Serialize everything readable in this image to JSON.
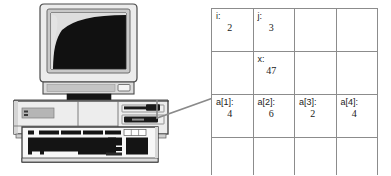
{
  "figure": {
    "caption": "",
    "connector": {
      "name": "leader-line",
      "color": "#8a8a8a"
    }
  },
  "computer": {
    "name": "desktop-computer-illustration",
    "parts": {
      "monitor": "crt-monitor",
      "screen": "monitor-screen",
      "screen_color": "#121212",
      "bezel_color": "#d9d9d9",
      "case": "desktop-case",
      "case_color": "#e6e6e6",
      "keyboard": "keyboard",
      "keyboard_color": "#f2f2f2",
      "drive_bay": "floppy-drive-bay",
      "power_button": "power-button"
    }
  },
  "memory_table": {
    "name": "memory-variables-table",
    "rows": [
      [
        {
          "label": "i:",
          "value": "2",
          "empty": false
        },
        {
          "label": "j:",
          "value": "3",
          "empty": false
        },
        {
          "label": "",
          "value": "",
          "empty": true
        },
        {
          "label": "",
          "value": "",
          "empty": true
        }
      ],
      [
        {
          "label": "",
          "value": "",
          "empty": true
        },
        {
          "label": "x:",
          "value": "47",
          "empty": false
        },
        {
          "label": "",
          "value": "",
          "empty": true
        },
        {
          "label": "",
          "value": "",
          "empty": true
        }
      ],
      [
        {
          "label": "a[1]:",
          "value": "4",
          "empty": false
        },
        {
          "label": "a[2]:",
          "value": "6",
          "empty": false
        },
        {
          "label": "a[3]:",
          "value": "2",
          "empty": false
        },
        {
          "label": "a[4]:",
          "value": "4",
          "empty": false
        }
      ],
      [
        {
          "label": "",
          "value": "",
          "empty": true
        },
        {
          "label": "",
          "value": "",
          "empty": true
        },
        {
          "label": "",
          "value": "",
          "empty": true
        },
        {
          "label": "",
          "value": "",
          "empty": true
        }
      ]
    ],
    "border_color": "#8c8c8c"
  }
}
